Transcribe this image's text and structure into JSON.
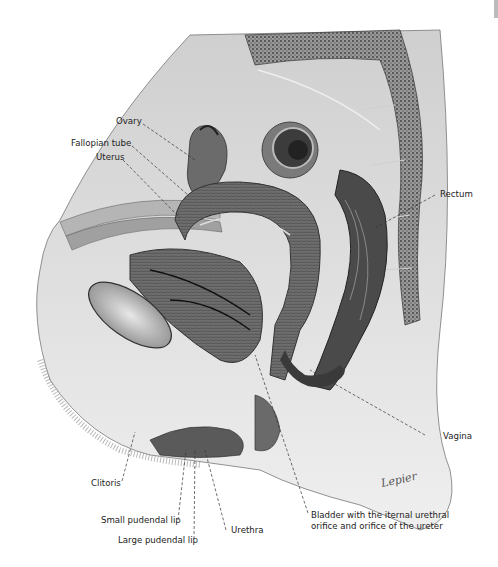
{
  "figure": {
    "signature": "Lepier",
    "labels": [
      {
        "id": "ovary",
        "text": "Ovary"
      },
      {
        "id": "fallopian-tube",
        "text": "Fallopian tube"
      },
      {
        "id": "uterus",
        "text": "Uterus"
      },
      {
        "id": "rectum",
        "text": "Rectum"
      },
      {
        "id": "vagina",
        "text": "Vagina"
      },
      {
        "id": "clitoris",
        "text": "Clitoris"
      },
      {
        "id": "small-pudendal-lip",
        "text": "Small pudendal lip"
      },
      {
        "id": "large-pudendal-lip",
        "text": "Large pudendal lip"
      },
      {
        "id": "urethra",
        "text": "Urethra"
      },
      {
        "id": "bladder",
        "text": "Bladder with the iternal urethral orifice and orifice of the ureter"
      }
    ]
  },
  "colors": {
    "ink": "#222222",
    "tissue_dark": "#4a4a4a",
    "tissue_mid": "#8c8c8c",
    "tissue_light": "#c8c8c8",
    "skin": "#dedede",
    "background": "#ffffff"
  }
}
